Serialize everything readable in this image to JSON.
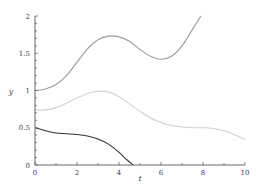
{
  "chart_data": {
    "type": "line",
    "title": "",
    "xlabel": "t",
    "ylabel": "y",
    "xlim": [
      0,
      10
    ],
    "ylim": [
      0,
      2
    ],
    "xticks": [
      0,
      2,
      4,
      6,
      8,
      10
    ],
    "xtick_labels": [
      "0",
      "2",
      "4",
      "6",
      "8",
      "10"
    ],
    "yticks": [
      0,
      0.5,
      1,
      1.5,
      2
    ],
    "ytick_labels": [
      "0",
      "0.5",
      "1",
      "1.5",
      "2"
    ],
    "grid": false,
    "legend": null,
    "series": [
      {
        "name": "upper",
        "color": "#9a9a9a",
        "x": [
          0,
          0.5,
          1,
          1.5,
          2,
          2.5,
          3,
          3.5,
          4,
          4.5,
          5,
          5.5,
          6,
          6.5,
          7,
          7.5,
          7.9
        ],
        "y": [
          1.0,
          1.02,
          1.08,
          1.2,
          1.38,
          1.56,
          1.68,
          1.73,
          1.72,
          1.66,
          1.55,
          1.46,
          1.42,
          1.46,
          1.6,
          1.82,
          2.0
        ]
      },
      {
        "name": "middle",
        "color": "#cfcfcf",
        "x": [
          0,
          0.5,
          1,
          1.5,
          2,
          2.5,
          3,
          3.5,
          4,
          4.5,
          5,
          5.5,
          6,
          6.5,
          7,
          7.5,
          8,
          8.5,
          9,
          9.5,
          10
        ],
        "y": [
          0.74,
          0.74,
          0.77,
          0.83,
          0.9,
          0.96,
          0.99,
          0.98,
          0.92,
          0.82,
          0.72,
          0.63,
          0.57,
          0.53,
          0.51,
          0.5,
          0.5,
          0.49,
          0.46,
          0.41,
          0.34
        ]
      },
      {
        "name": "lower",
        "color": "#333333",
        "x": [
          0,
          0.5,
          1,
          1.5,
          2,
          2.5,
          3,
          3.5,
          4,
          4.3,
          4.67
        ],
        "y": [
          0.5,
          0.46,
          0.43,
          0.42,
          0.41,
          0.39,
          0.35,
          0.28,
          0.17,
          0.09,
          0.0
        ]
      }
    ]
  }
}
